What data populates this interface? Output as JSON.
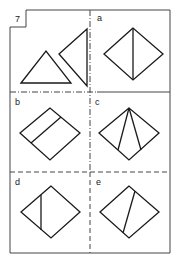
{
  "puzzle": {
    "number": "7",
    "question_label": "7",
    "options": [
      {
        "label": "a",
        "description": "diamond with vertical line from top to bottom vertex"
      },
      {
        "label": "b",
        "description": "diamond with line parallel to upper-left edge"
      },
      {
        "label": "c",
        "description": "diamond with two lines from top vertex to bottom edges"
      },
      {
        "label": "d",
        "description": "diamond with vertical line left of center"
      },
      {
        "label": "e",
        "description": "diamond with slanted line from upper-right edge to lower-left edge"
      }
    ]
  },
  "colors": {
    "line": "#1a1a1a",
    "frame": "#444444",
    "background": "#ffffff"
  }
}
